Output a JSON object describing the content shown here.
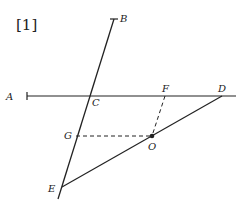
{
  "figure": {
    "tag": "[1]",
    "labels": {
      "A": "A",
      "B": "B",
      "C": "C",
      "D": "D",
      "E": "E",
      "F": "F",
      "G": "G",
      "O": "O"
    },
    "stroke_color": "#222222",
    "background": "#ffffff"
  }
}
